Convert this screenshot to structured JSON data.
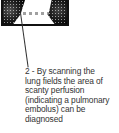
{
  "figure": {
    "image_description": "lung perfusion scan showing dark speckled lung fields",
    "caption_lines": [
      "2 - By scanning the",
      "lung fields the area of",
      "scanty perfusion",
      "(indicating a pulmonary",
      "embolus) can be",
      "diagnosed"
    ]
  },
  "colors": {
    "border": "#111111",
    "text": "#333333",
    "background": "#ffffff"
  }
}
